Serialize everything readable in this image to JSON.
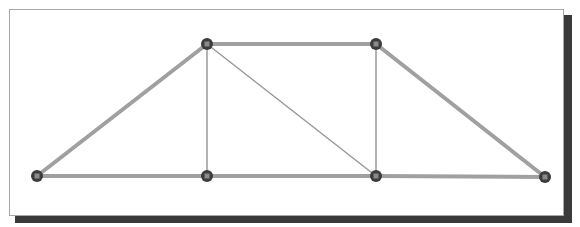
{
  "diagram": {
    "type": "truss",
    "caption_remnant": "",
    "nodes": [
      {
        "id": "n1",
        "x": 37,
        "y": 176
      },
      {
        "id": "n2",
        "x": 207,
        "y": 176
      },
      {
        "id": "n3",
        "x": 376,
        "y": 176
      },
      {
        "id": "n4",
        "x": 545,
        "y": 177
      },
      {
        "id": "n5",
        "x": 207,
        "y": 44
      },
      {
        "id": "n6",
        "x": 376,
        "y": 44
      }
    ],
    "members": [
      {
        "from": "n1",
        "to": "n2",
        "weight": "thick"
      },
      {
        "from": "n2",
        "to": "n3",
        "weight": "thick"
      },
      {
        "from": "n3",
        "to": "n4",
        "weight": "thick"
      },
      {
        "from": "n5",
        "to": "n6",
        "weight": "thick"
      },
      {
        "from": "n1",
        "to": "n5",
        "weight": "thick"
      },
      {
        "from": "n6",
        "to": "n4",
        "weight": "thick"
      },
      {
        "from": "n2",
        "to": "n5",
        "weight": "thin"
      },
      {
        "from": "n3",
        "to": "n6",
        "weight": "thin"
      },
      {
        "from": "n5",
        "to": "n3",
        "weight": "thin"
      }
    ],
    "colors": {
      "thick_member": "#a0a0a0",
      "thin_member": "#9a9a9a",
      "node_fill": "#3c3c3c",
      "node_center": "#8a8a8a",
      "frame_border": "#a8a8a8",
      "shadow": "#3a3a3a"
    }
  }
}
